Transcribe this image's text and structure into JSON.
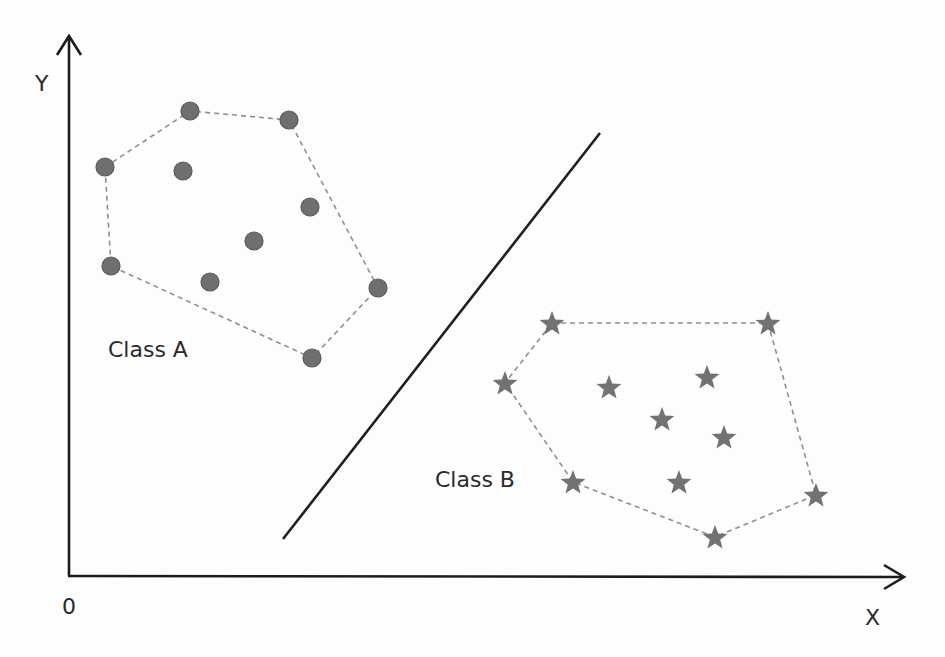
{
  "chart_data": {
    "type": "scatter",
    "title": "",
    "xlabel": "X",
    "ylabel": "Y",
    "origin_label": "0",
    "grid": false,
    "legend": null,
    "axes": {
      "origin": [
        68,
        575
      ],
      "x_axis_end": [
        905,
        577
      ],
      "y_axis_end": [
        69,
        35
      ]
    },
    "decision_boundary": {
      "type": "line",
      "from": [
        283,
        539
      ],
      "to": [
        600,
        133
      ]
    },
    "series": [
      {
        "name": "Class A",
        "marker": "circle",
        "color": "#6f6f6f",
        "label_position": [
          108,
          357
        ],
        "points": [
          [
            105,
            167
          ],
          [
            190,
            111
          ],
          [
            289,
            120
          ],
          [
            183,
            171
          ],
          [
            310,
            207
          ],
          [
            254,
            241
          ],
          [
            111,
            266
          ],
          [
            210,
            282
          ],
          [
            378,
            288
          ],
          [
            312,
            358
          ]
        ],
        "hull": [
          [
            105,
            167
          ],
          [
            190,
            111
          ],
          [
            289,
            120
          ],
          [
            378,
            288
          ],
          [
            312,
            358
          ],
          [
            111,
            266
          ]
        ]
      },
      {
        "name": "Class B",
        "marker": "star",
        "color": "#727272",
        "label_position": [
          435,
          487
        ],
        "points": [
          [
            552,
            323
          ],
          [
            768,
            323
          ],
          [
            505,
            383
          ],
          [
            609,
            387
          ],
          [
            707,
            377
          ],
          [
            662,
            419
          ],
          [
            724,
            437
          ],
          [
            573,
            482
          ],
          [
            679,
            482
          ],
          [
            816,
            495
          ],
          [
            715,
            537
          ]
        ],
        "hull": [
          [
            552,
            323
          ],
          [
            768,
            323
          ],
          [
            816,
            495
          ],
          [
            715,
            537
          ],
          [
            573,
            482
          ],
          [
            505,
            383
          ]
        ]
      }
    ]
  },
  "labels": {
    "y_axis": "Y",
    "x_axis": "X",
    "origin": "0",
    "class_a": "Class A",
    "class_b": "Class B"
  },
  "colors": {
    "axis": "#1c1c1c",
    "boundary": "#1f1f1f",
    "hull": "#8f8f8f",
    "class_a": "#6f6f6f",
    "class_b": "#727272",
    "text": "#2a2a2a"
  }
}
